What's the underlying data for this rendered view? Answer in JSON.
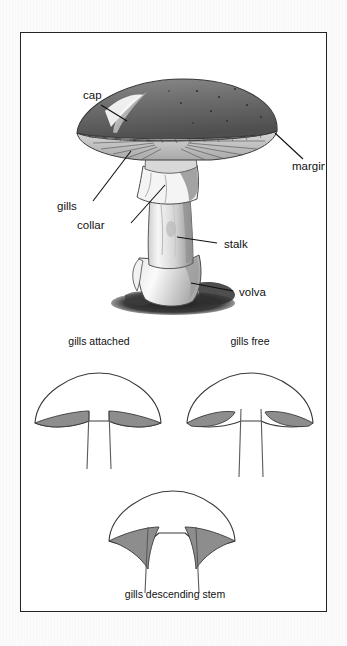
{
  "figure": {
    "colors": {
      "page_background": "#fbfbfb",
      "frame_background": "#ffffff",
      "frame_border": "#242424",
      "ink": "#111111",
      "gill_gray": "#8d8d8d",
      "cap_dark": "#6f6f6f",
      "soil_dark": "#2b2b2b"
    },
    "top_panel": {
      "name": "labeled-mushroom-illustration",
      "labels": [
        {
          "id": "cap",
          "text": "cap",
          "x": 62,
          "y": 66
        },
        {
          "id": "margin",
          "text": "margin",
          "x": 271,
          "y": 137
        },
        {
          "id": "gills",
          "text": "gills",
          "x": 56,
          "y": 177
        },
        {
          "id": "collar",
          "text": "collar",
          "x": 76,
          "y": 196
        },
        {
          "id": "stalk",
          "text": "stalk",
          "x": 203,
          "y": 215
        },
        {
          "id": "volva",
          "text": "volva",
          "x": 218,
          "y": 266
        }
      ]
    },
    "bottom_panel": {
      "name": "gill-attachment-types",
      "diagrams": [
        {
          "id": "gills-attached",
          "caption": "gills attached",
          "caption_x": 116,
          "caption_y": 341
        },
        {
          "id": "gills-free",
          "caption": "gills free",
          "caption_x": 250,
          "caption_y": 341
        },
        {
          "id": "gills-descending-stem",
          "caption": "gills descending stem",
          "caption_x": 174,
          "caption_y": 594
        }
      ]
    }
  }
}
